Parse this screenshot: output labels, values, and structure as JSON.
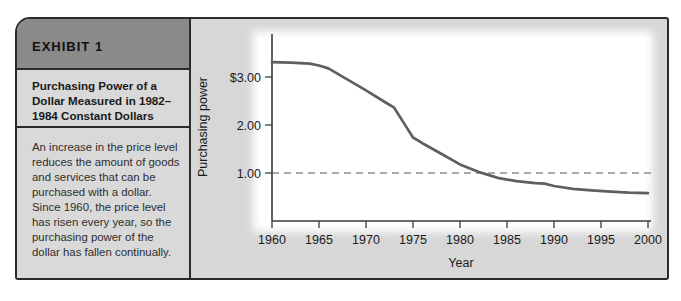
{
  "exhibit": {
    "header_label": "EXHIBIT 1",
    "title": "Purchasing Power of a Dollar Measured in 1982–1984 Constant Dollars",
    "body": "An increase in the price level reduces the amount of goods and services that can be purchased with a dollar. Since 1960, the price level has risen every year, so the purchasing power of the dollar has fallen continually."
  },
  "chart_data": {
    "type": "line",
    "title": "",
    "xlabel": "Year",
    "ylabel": "Purchasing power",
    "xlim": [
      1960,
      2000
    ],
    "ylim": [
      0,
      3.9
    ],
    "grid": false,
    "x_ticks": [
      1960,
      1965,
      1970,
      1975,
      1980,
      1985,
      1990,
      1995,
      2000
    ],
    "y_ticks": [
      {
        "value": 3.0,
        "label": "$3.00"
      },
      {
        "value": 2.0,
        "label": "2.00"
      },
      {
        "value": 1.0,
        "label": "1.00"
      }
    ],
    "reference_line": {
      "value": 1.0,
      "style": "dashed",
      "color": "#8f8f8f"
    },
    "series": [
      {
        "name": "Purchasing power of a dollar (1982–1984 constant dollars)",
        "x": [
          1960,
          1962,
          1964,
          1965,
          1966,
          1968,
          1970,
          1972,
          1973,
          1974,
          1975,
          1976,
          1978,
          1980,
          1982,
          1983,
          1984,
          1986,
          1988,
          1989,
          1990,
          1992,
          1994,
          1996,
          1998,
          2000
        ],
        "y": [
          3.31,
          3.3,
          3.28,
          3.24,
          3.18,
          2.95,
          2.72,
          2.48,
          2.36,
          2.05,
          1.74,
          1.62,
          1.4,
          1.18,
          1.02,
          0.96,
          0.9,
          0.83,
          0.79,
          0.78,
          0.73,
          0.67,
          0.64,
          0.61,
          0.59,
          0.58
        ],
        "color": "#5f5f5f"
      }
    ]
  },
  "colors": {
    "header_band": "#8a8a8a",
    "panel_gray": "#d9d9d9",
    "border_dark": "#2b2b2b",
    "axis": "#3a3a3a",
    "plot_background": "#ffffff"
  }
}
